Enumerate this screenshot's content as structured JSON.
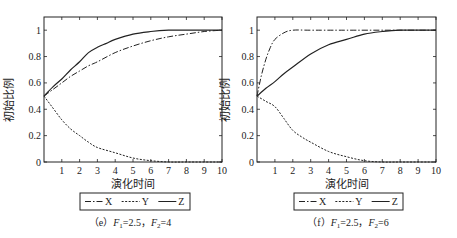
{
  "chart_data": [
    {
      "type": "line",
      "title": "",
      "caption": "(e) F1=2.5, F2=4",
      "caption_parts": {
        "prefix": "（e）",
        "f1_label": "F",
        "f1_sub": "1",
        "f1_val": "=2.5，",
        "f2_label": "F",
        "f2_sub": "2",
        "f2_val": "=4"
      },
      "xlabel": "演化时间",
      "ylabel": "初始比例",
      "xlim": [
        0,
        10
      ],
      "ylim": [
        0,
        1.1
      ],
      "xticks": [
        1,
        2,
        3,
        4,
        5,
        6,
        7,
        8,
        9,
        10
      ],
      "yticks": [
        0,
        0.2,
        0.4,
        0.6,
        0.8,
        1
      ],
      "ytick_labels": [
        "0",
        "0.2",
        "0.4",
        "0.6",
        "0.8",
        "1"
      ],
      "grid": false,
      "legend_position": "below",
      "series": [
        {
          "name": "X",
          "style": "dash-dot",
          "x": [
            0,
            0.5,
            1,
            1.5,
            2,
            2.5,
            3,
            4,
            5,
            6,
            7,
            8,
            9,
            10
          ],
          "values": [
            0.5,
            0.55,
            0.6,
            0.65,
            0.69,
            0.73,
            0.76,
            0.83,
            0.88,
            0.92,
            0.95,
            0.97,
            0.99,
            1.0
          ]
        },
        {
          "name": "Y",
          "style": "dotted",
          "x": [
            0,
            0.5,
            1,
            1.5,
            2,
            2.5,
            3,
            4,
            5,
            6,
            7,
            8,
            10
          ],
          "values": [
            0.5,
            0.41,
            0.32,
            0.25,
            0.2,
            0.15,
            0.11,
            0.07,
            0.03,
            0.01,
            0.0,
            0.0,
            0.0
          ]
        },
        {
          "name": "Z",
          "style": "solid",
          "x": [
            0,
            0.5,
            1,
            1.5,
            2,
            2.5,
            3,
            3.5,
            4,
            5,
            6,
            7,
            8,
            10
          ],
          "values": [
            0.5,
            0.57,
            0.63,
            0.7,
            0.76,
            0.83,
            0.87,
            0.9,
            0.93,
            0.97,
            0.99,
            1.0,
            1.0,
            1.0
          ]
        }
      ]
    },
    {
      "type": "line",
      "title": "",
      "caption": "(f) F1=2.5, F2=6",
      "caption_parts": {
        "prefix": "（f）",
        "f1_label": "F",
        "f1_sub": "1",
        "f1_val": "=2.5，",
        "f2_label": "F",
        "f2_sub": "2",
        "f2_val": "=6"
      },
      "xlabel": "演化时间",
      "ylabel": "初始比例",
      "xlim": [
        0,
        10
      ],
      "ylim": [
        0,
        1.1
      ],
      "xticks": [
        1,
        2,
        3,
        4,
        5,
        6,
        7,
        8,
        9,
        10
      ],
      "yticks": [
        0,
        0.2,
        0.4,
        0.6,
        0.8,
        1
      ],
      "ytick_labels": [
        "0",
        "0.2",
        "0.4",
        "0.6",
        "0.8",
        "1"
      ],
      "grid": false,
      "legend_position": "below",
      "series": [
        {
          "name": "X",
          "style": "dash-dot",
          "x": [
            0,
            0.25,
            0.5,
            0.75,
            1,
            1.5,
            2,
            3,
            5,
            10
          ],
          "values": [
            0.5,
            0.66,
            0.78,
            0.87,
            0.93,
            0.98,
            1.0,
            1.0,
            1.0,
            1.0
          ]
        },
        {
          "name": "Y",
          "style": "dotted",
          "x": [
            0,
            0.5,
            1,
            1.5,
            2,
            2.5,
            3,
            4,
            5,
            6,
            7,
            8,
            10
          ],
          "values": [
            0.5,
            0.46,
            0.42,
            0.33,
            0.24,
            0.19,
            0.15,
            0.08,
            0.04,
            0.01,
            0.0,
            0.0,
            0.0
          ]
        },
        {
          "name": "Z",
          "style": "solid",
          "x": [
            0,
            0.5,
            1,
            1.5,
            2,
            3,
            4,
            5,
            6,
            7,
            8,
            10
          ],
          "values": [
            0.5,
            0.56,
            0.61,
            0.67,
            0.72,
            0.82,
            0.89,
            0.93,
            0.97,
            0.99,
            1.0,
            1.0
          ]
        }
      ]
    }
  ],
  "legend": {
    "items": [
      {
        "label": "X",
        "style": "dash-dot"
      },
      {
        "label": "Y",
        "style": "dotted"
      },
      {
        "label": "Z",
        "style": "solid"
      }
    ]
  },
  "colors": {
    "line": "#222222",
    "axis": "#222222",
    "background": "#ffffff"
  }
}
